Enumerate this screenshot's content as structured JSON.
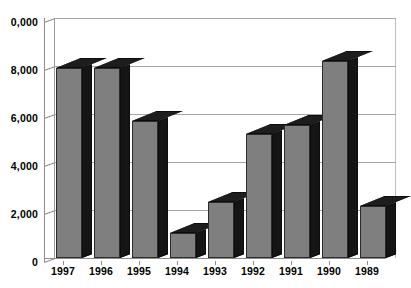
{
  "chart_data": {
    "type": "bar",
    "title": "",
    "subtitle": "",
    "xlabel": "",
    "ylabel": "",
    "categories": [
      "1997",
      "1996",
      "1995",
      "1994",
      "1993",
      "1992",
      "1991",
      "1990",
      "1989"
    ],
    "values": [
      7900,
      7900,
      5700,
      1050,
      2350,
      5150,
      5550,
      8200,
      2150
    ],
    "series": [
      {
        "name": "",
        "values": [
          7900,
          7900,
          5700,
          1050,
          2350,
          5150,
          5550,
          8200,
          2150
        ]
      }
    ],
    "ylim": [
      0,
      10000
    ],
    "yticks": [
      0,
      2000,
      4000,
      6000,
      8000,
      10000
    ],
    "ytick_labels": [
      "0",
      "2,000",
      "4,000",
      "6,000",
      "8,000",
      "0,000"
    ],
    "xtick_labels": [
      "1997",
      "1996",
      "1995",
      "1994",
      "1993",
      "1992",
      "1991",
      "1990",
      "1989"
    ],
    "grid": true,
    "grid_axis": "y",
    "legend": false,
    "legend_position": "none",
    "style": "3d-column",
    "annotations": [],
    "colors": {
      "bar_front": "#7f7f7f",
      "bar_side": "#151515",
      "bar_top": "#1d1d1d",
      "bar_outline": "#2b2b2b",
      "gridline": "#a6a6a6",
      "axis": "#8d8d8d",
      "background": "#ffffff",
      "text": "#000000"
    }
  }
}
